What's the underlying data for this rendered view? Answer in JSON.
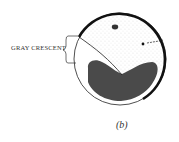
{
  "figure": {
    "labels": {
      "crescent": "GRAY CRESCENT",
      "panel": "(b)"
    },
    "colors": {
      "outline": "#111111",
      "yolk": "#4a4a4a",
      "stipple": "#9a9a9a",
      "background": "#ffffff"
    }
  }
}
